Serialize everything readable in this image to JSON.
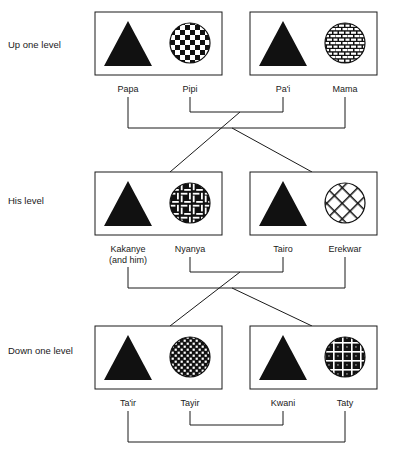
{
  "diagram": {
    "levels": [
      {
        "id": "up-one-level",
        "label": "Up one level",
        "label_y": 44,
        "box_y": 12,
        "box_height": 63,
        "label_row_y": 90,
        "units": [
          {
            "id": "unit-papa-pipi",
            "box_x": 95,
            "box_width": 127,
            "male": {
              "name": "Papa",
              "label_x": 128,
              "shape": "triangle",
              "cx": 128,
              "cy": 44
            },
            "female": {
              "name": "Pipi",
              "label_x": 190,
              "shape": "circle",
              "pattern": "checkerboard",
              "cx": 190,
              "cy": 43
            }
          },
          {
            "id": "unit-pai-mama",
            "box_x": 250,
            "box_width": 127,
            "male": {
              "name": "Pa'i",
              "label_x": 283,
              "shape": "triangle",
              "cx": 283,
              "cy": 44
            },
            "female": {
              "name": "Mama",
              "label_x": 345,
              "shape": "circle",
              "pattern": "brick",
              "cx": 345,
              "cy": 43
            }
          }
        ]
      },
      {
        "id": "his-level",
        "label": "His level",
        "label_y": 200,
        "box_y": 172,
        "box_height": 63,
        "label_row_y": 250,
        "units": [
          {
            "id": "unit-kakanye-nyanya",
            "box_x": 95,
            "box_width": 127,
            "male": {
              "name": "Kakanye",
              "name_line2": "(and him)",
              "label_x": 128,
              "shape": "triangle",
              "cx": 128,
              "cy": 204
            },
            "female": {
              "name": "Nyanya",
              "label_x": 190,
              "shape": "circle",
              "pattern": "basketweave",
              "cx": 190,
              "cy": 203
            }
          },
          {
            "id": "unit-tairo-erekwar",
            "box_x": 250,
            "box_width": 127,
            "male": {
              "name": "Tairo",
              "label_x": 283,
              "shape": "triangle",
              "cx": 283,
              "cy": 204
            },
            "female": {
              "name": "Erekwar",
              "label_x": 345,
              "shape": "circle",
              "pattern": "lattice",
              "cx": 345,
              "cy": 203
            }
          }
        ]
      },
      {
        "id": "down-one-level",
        "label": "Down one level",
        "label_y": 350,
        "box_y": 326,
        "box_height": 63,
        "label_row_y": 404,
        "units": [
          {
            "id": "unit-tair-tayir",
            "box_x": 95,
            "box_width": 127,
            "male": {
              "name": "Ta'ir",
              "label_x": 128,
              "shape": "triangle",
              "cx": 128,
              "cy": 358
            },
            "female": {
              "name": "Tayir",
              "label_x": 190,
              "shape": "circle",
              "pattern": "fine-check",
              "cx": 190,
              "cy": 357
            }
          },
          {
            "id": "unit-kwani-taty",
            "box_x": 250,
            "box_width": 127,
            "male": {
              "name": "Kwani",
              "label_x": 283,
              "shape": "triangle",
              "cx": 283,
              "cy": 358
            },
            "female": {
              "name": "Taty",
              "label_x": 345,
              "shape": "circle",
              "pattern": "plaid",
              "cx": 345,
              "cy": 357
            }
          }
        ]
      }
    ],
    "connectors": [
      {
        "id": "marriage-pipi-pai",
        "type": "marriage-bracket",
        "points": "190,95 190,111 283,111 283,95"
      },
      {
        "id": "marriage-papa-mama",
        "type": "marriage-bracket",
        "points": "128,95 128,127 345,127 345,95"
      },
      {
        "id": "descent-pipi-pai-to-left",
        "type": "descent-diagonal",
        "points": "240,111 222,128 170,172"
      },
      {
        "id": "descent-papa-mama-to-right",
        "type": "descent-diagonal",
        "points": "232,127 250,144 312,172"
      },
      {
        "id": "marriage-nyanya-tairo",
        "type": "marriage-bracket",
        "points": "190,255 190,271 283,271 283,255"
      },
      {
        "id": "marriage-kakanye-erekwar",
        "type": "marriage-bracket",
        "points": "128,262 128,287 345,287 345,255"
      },
      {
        "id": "descent-nyanya-tairo-to-left",
        "type": "descent-diagonal",
        "points": "240,271 222,288 170,326"
      },
      {
        "id": "descent-kakanye-erekwar-to-right",
        "type": "descent-diagonal",
        "points": "232,287 250,303 312,326"
      },
      {
        "id": "marriage-tayir-kwani",
        "type": "marriage-bracket",
        "points": "190,409 190,424 283,424 283,409"
      },
      {
        "id": "marriage-tair-taty",
        "type": "marriage-bracket",
        "points": "128,409 128,441 345,441 345,409"
      }
    ]
  }
}
